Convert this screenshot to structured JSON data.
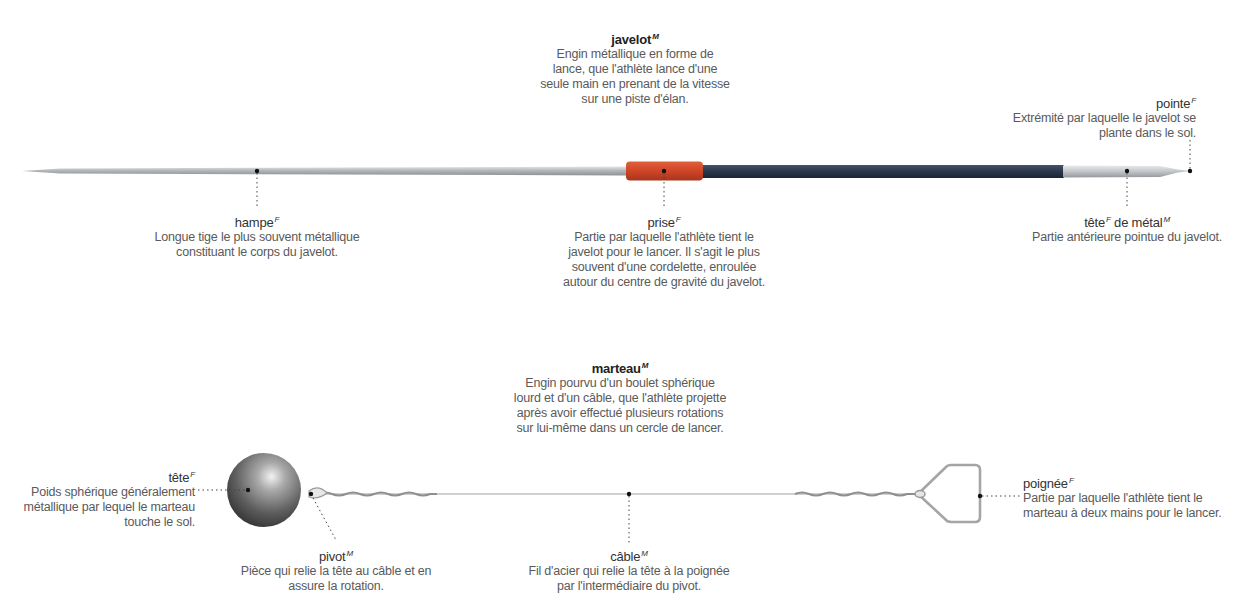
{
  "javelin": {
    "title": {
      "term": "javelot",
      "gender": "M",
      "lines": [
        "Engin métallique en forme de",
        "lance, que l'athlète lance d'une",
        "seule main en prenant de la vitesse",
        "sur une piste d'élan."
      ]
    },
    "parts": {
      "pointe": {
        "term": "pointe",
        "gender": "F",
        "lines": [
          "Extrémité par laquelle le javelot se",
          "plante dans le sol."
        ]
      },
      "hampe": {
        "term": "hampe",
        "gender": "F",
        "lines": [
          "Longue tige le plus souvent métallique",
          "constituant le corps du javelot."
        ]
      },
      "prise": {
        "term": "prise",
        "gender": "F",
        "lines": [
          "Partie par laquelle l'athlète tient le",
          "javelot pour le lancer. Il s'agit le plus",
          "souvent d'une cordelette, enroulée",
          "autour du centre de gravité du javelot."
        ]
      },
      "tete_metal": {
        "term_a": "tête",
        "gender_a": "F",
        "term_b": " de métal",
        "gender_b": "M",
        "lines": [
          "Partie antérieure pointue du javelot."
        ]
      }
    },
    "colors": {
      "shaft": "#b9bcbf",
      "grip": "#d2472a",
      "body": "#2c3a52",
      "head": "#c8cbce"
    }
  },
  "hammer": {
    "title": {
      "term": "marteau",
      "gender": "M",
      "lines": [
        "Engin pourvu d'un boulet sphérique",
        "lourd et d'un câble, que l'athlète projette",
        "après avoir effectué plusieurs rotations",
        "sur lui-même dans un cercle de lancer."
      ]
    },
    "parts": {
      "tete": {
        "term": "tête",
        "gender": "F",
        "lines": [
          "Poids sphérique généralement",
          "métallique par lequel le marteau",
          "touche le sol."
        ]
      },
      "pivot": {
        "term": "pivot",
        "gender": "M",
        "lines": [
          "Pièce qui relie la tête au câble et en",
          "assure la rotation."
        ]
      },
      "cable": {
        "term": "câble",
        "gender": "M",
        "lines": [
          "Fil d'acier qui relie la tête à la poignée",
          "par l'intermédiaire du pivot."
        ]
      },
      "poignee": {
        "term": "poignée",
        "gender": "F",
        "lines": [
          "Partie par laquelle l'athlète tient le",
          "marteau à deux mains pour le lancer."
        ]
      }
    },
    "colors": {
      "ball": "#6e6e6e",
      "cable": "#9a9a9a",
      "handle": "#a8a8a8"
    }
  }
}
